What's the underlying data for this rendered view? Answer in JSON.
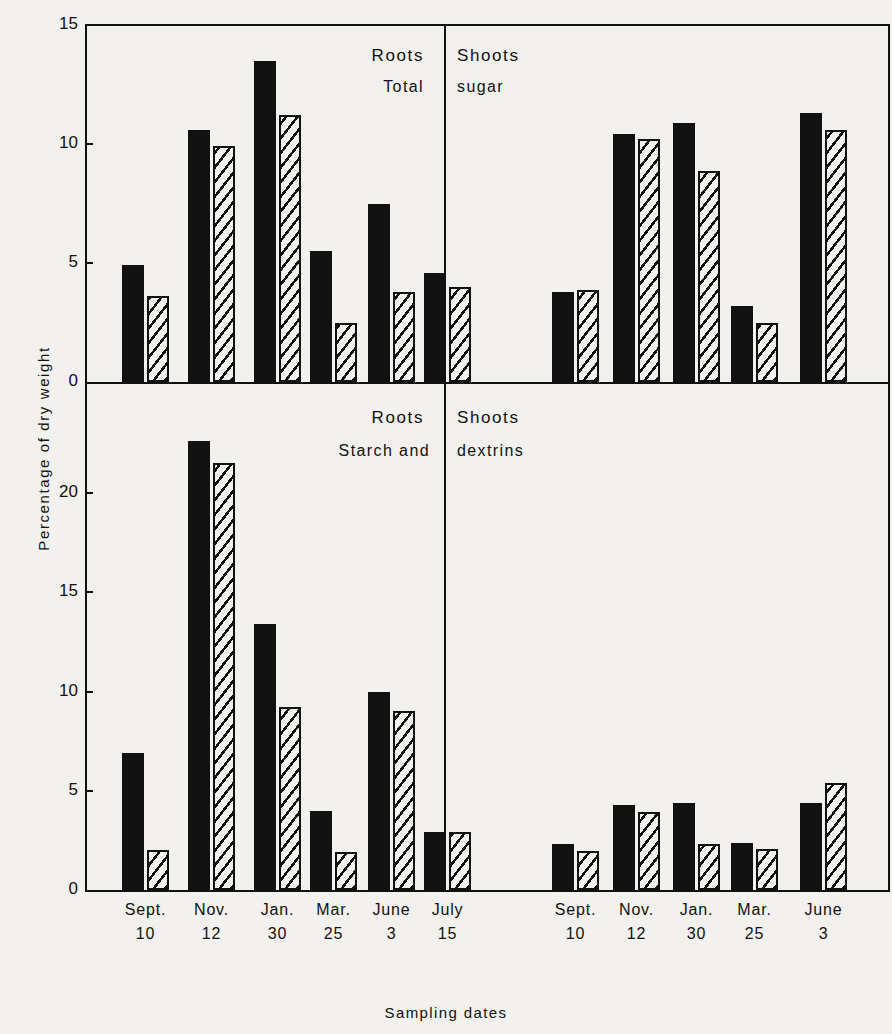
{
  "axes": {
    "ylabel": "Percentage of dry weight",
    "xlabel": "Sampling dates",
    "top_yticks": [
      "15",
      "10",
      "5",
      "0"
    ],
    "bottom_yticks": [
      "20",
      "15",
      "10",
      "5",
      "0"
    ]
  },
  "panels": {
    "top_left": {
      "organ": "Roots",
      "measure": "Total"
    },
    "top_right": {
      "organ": "Shoots",
      "measure": "sugar"
    },
    "bottom_left": {
      "organ": "Roots",
      "measure": "Starch and"
    },
    "bottom_right": {
      "organ": "Shoots",
      "measure": "dextrins"
    }
  },
  "categories_long": [
    {
      "month": "Sept.",
      "day": "10"
    },
    {
      "month": "Nov.",
      "day": "12"
    },
    {
      "month": "Jan.",
      "day": "30"
    },
    {
      "month": "Mar.",
      "day": "25"
    },
    {
      "month": "June",
      "day": "3"
    },
    {
      "month": "July",
      "day": "15"
    }
  ],
  "categories_short": [
    {
      "month": "Sept.",
      "day": "10"
    },
    {
      "month": "Nov.",
      "day": "12"
    },
    {
      "month": "Jan.",
      "day": "30"
    },
    {
      "month": "Mar.",
      "day": "25"
    },
    {
      "month": "June",
      "day": "3"
    }
  ],
  "colors": {
    "ink": "#111111",
    "paper": "#f2f1ee"
  },
  "chart_data": [
    {
      "type": "bar",
      "title": "Roots — Total sugar",
      "panel": "top_left",
      "xlabel": "Sampling dates",
      "ylabel": "Percentage of dry weight",
      "ylim": [
        0,
        15
      ],
      "yticks": [
        0,
        5,
        10,
        15
      ],
      "grid": false,
      "legend": "none",
      "categories": [
        "Sept. 10",
        "Nov. 12",
        "Jan. 30",
        "Mar. 25",
        "June 3",
        "July 15"
      ],
      "series": [
        {
          "name": "solid",
          "style": "solid-black",
          "values": [
            4.9,
            10.6,
            13.5,
            5.5,
            7.5,
            4.6
          ]
        },
        {
          "name": "hatched",
          "style": "diagonal-hatch",
          "values": [
            3.6,
            9.9,
            11.2,
            2.5,
            3.8,
            4.0
          ]
        }
      ]
    },
    {
      "type": "bar",
      "title": "Shoots — Total sugar",
      "panel": "top_right",
      "xlabel": "Sampling dates",
      "ylabel": "Percentage of dry weight",
      "ylim": [
        0,
        15
      ],
      "yticks": [
        0,
        5,
        10,
        15
      ],
      "grid": false,
      "legend": "none",
      "categories": [
        "Sept. 10",
        "Nov. 12",
        "Jan. 30",
        "Mar. 25",
        "June 3"
      ],
      "series": [
        {
          "name": "solid",
          "style": "solid-black",
          "values": [
            3.8,
            10.4,
            10.9,
            3.2,
            11.3
          ]
        },
        {
          "name": "hatched",
          "style": "diagonal-hatch",
          "values": [
            3.85,
            10.2,
            8.85,
            2.5,
            10.6
          ]
        }
      ]
    },
    {
      "type": "bar",
      "title": "Roots — Starch and dextrins",
      "panel": "bottom_left",
      "xlabel": "Sampling dates",
      "ylabel": "Percentage of dry weight",
      "ylim": [
        0,
        23.5
      ],
      "yticks": [
        0,
        5,
        10,
        15,
        20
      ],
      "grid": false,
      "legend": "none",
      "categories": [
        "Sept. 10",
        "Nov. 12",
        "Jan. 30",
        "Mar. 25",
        "June 3",
        "July 15"
      ],
      "series": [
        {
          "name": "solid",
          "style": "solid-black",
          "values": [
            6.9,
            22.6,
            13.4,
            4.0,
            10.0,
            2.9
          ]
        },
        {
          "name": "hatched",
          "style": "diagonal-hatch",
          "values": [
            2.0,
            21.5,
            9.2,
            1.9,
            9.0,
            2.9
          ]
        }
      ]
    },
    {
      "type": "bar",
      "title": "Shoots — Starch and dextrins",
      "panel": "bottom_right",
      "xlabel": "Sampling dates",
      "ylabel": "Percentage of dry weight",
      "ylim": [
        0,
        23.5
      ],
      "yticks": [
        0,
        5,
        10,
        15,
        20
      ],
      "grid": false,
      "legend": "none",
      "categories": [
        "Sept. 10",
        "Nov. 12",
        "Jan. 30",
        "Mar. 25",
        "June 3"
      ],
      "series": [
        {
          "name": "solid",
          "style": "solid-black",
          "values": [
            2.3,
            4.3,
            4.4,
            2.35,
            4.4
          ]
        },
        {
          "name": "hatched",
          "style": "diagonal-hatch",
          "values": [
            1.95,
            3.95,
            2.3,
            2.05,
            5.4
          ]
        }
      ]
    }
  ]
}
